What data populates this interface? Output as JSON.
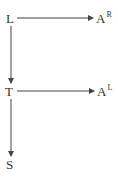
{
  "diagram": {
    "type": "directed-graph",
    "nodes": [
      {
        "id": "L",
        "label": "L",
        "sup": "",
        "x": 11,
        "y": 18
      },
      {
        "id": "AR",
        "label": "A",
        "sup": "R",
        "x": 100,
        "y": 18
      },
      {
        "id": "T",
        "label": "T",
        "sup": "",
        "x": 11,
        "y": 91
      },
      {
        "id": "AL",
        "label": "A",
        "sup": "L",
        "x": 101,
        "y": 91
      },
      {
        "id": "S",
        "label": "S",
        "sup": "",
        "x": 11,
        "y": 164
      }
    ],
    "edges": [
      {
        "from": "L",
        "to": "AR"
      },
      {
        "from": "L",
        "to": "T"
      },
      {
        "from": "T",
        "to": "AL"
      },
      {
        "from": "T",
        "to": "S"
      }
    ],
    "colors": {
      "stroke": "#444444",
      "text": "#333333",
      "background": "#ffffff"
    }
  }
}
